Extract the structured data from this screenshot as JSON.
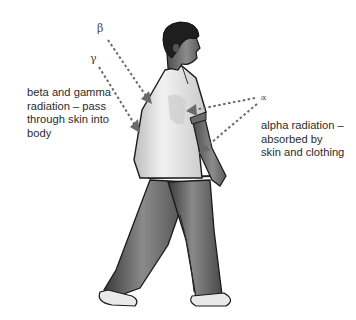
{
  "figure": {
    "symbols": {
      "beta": "β",
      "gamma": "γ",
      "alpha": "∝"
    },
    "captions": {
      "left": "beta and gamma\nradiation – pass\nthrough skin into\nbody",
      "right": "alpha radiation –\nabsorbed by\nskin and clothing"
    },
    "arrows": [
      {
        "type": "beta",
        "from": [
          108,
          40
        ],
        "to": [
          150,
          102
        ],
        "meaning": "passes through skin into body"
      },
      {
        "type": "gamma",
        "from": [
          99,
          67
        ],
        "to": [
          139,
          131
        ],
        "meaning": "passes through skin into body"
      },
      {
        "type": "alpha",
        "from": [
          255,
          98
        ],
        "to": [
          187,
          111
        ],
        "meaning": "absorbed by skin and clothing"
      },
      {
        "type": "alpha",
        "from": [
          257,
          104
        ],
        "to": [
          200,
          153
        ],
        "meaning": "absorbed by skin and clothing"
      }
    ],
    "colors": {
      "arrow": "#6a6a6a",
      "text": "#2b2b2b",
      "background": "#ffffff"
    }
  }
}
